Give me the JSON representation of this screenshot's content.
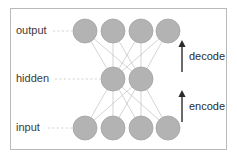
{
  "figure": {
    "canvas": {
      "width": 237,
      "height": 158
    },
    "background_color": "#ffffff",
    "frame": {
      "x": 10,
      "y": 8,
      "width": 216,
      "height": 141,
      "stroke_color": "#b9b9b9"
    }
  },
  "colors": {
    "node_fill": "#b3b3b3",
    "node_stroke": "#a3a3a3",
    "edge": "#c2c2c2",
    "leader": "#cfcfcf",
    "arrow": "#2b2b2b",
    "label_text": "#3a3a3a"
  },
  "chart_data": {
    "type": "diagram",
    "layers": [
      {
        "name": "output",
        "label": "output",
        "node_count": 4,
        "y": 31,
        "node_x": [
          85,
          113,
          141,
          168
        ],
        "radius": 12
      },
      {
        "name": "hidden",
        "label": "hidden",
        "node_count": 2,
        "y": 79,
        "node_x": [
          113,
          141
        ],
        "radius": 12
      },
      {
        "name": "input",
        "label": "input",
        "node_count": 4,
        "y": 128,
        "node_x": [
          85,
          113,
          141,
          168
        ],
        "radius": 12
      }
    ],
    "connections": [
      {
        "from": "hidden",
        "to": "output",
        "kind": "fully-connected"
      },
      {
        "from": "input",
        "to": "hidden",
        "kind": "fully-connected"
      }
    ],
    "layer_labels": [
      {
        "text": "output",
        "x": 16,
        "y": 31,
        "leader_from": 53,
        "leader_to": 72
      },
      {
        "text": "hidden",
        "x": 16,
        "y": 79,
        "leader_from": 55,
        "leader_to": 100
      },
      {
        "text": "input",
        "x": 16,
        "y": 128,
        "leader_from": 48,
        "leader_to": 72
      }
    ],
    "flow_arrows": [
      {
        "label": "decode",
        "x": 182,
        "y_bottom": 72,
        "y_top": 40,
        "direction": "up",
        "label_x": 189,
        "label_y": 57
      },
      {
        "label": "encode",
        "x": 182,
        "y_bottom": 122,
        "y_top": 90,
        "direction": "up",
        "label_x": 189,
        "label_y": 107
      }
    ]
  }
}
